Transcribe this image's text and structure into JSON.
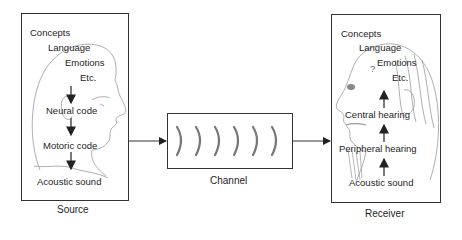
{
  "diagram": {
    "source": {
      "caption": "Source",
      "labels": [
        "Concepts",
        "Language",
        "Emotions",
        "Etc.",
        "Neural code",
        "Motoric code",
        "Acoustic sound"
      ]
    },
    "channel": {
      "caption": "Channel",
      "wave_count": 6,
      "wave_color": "#777777"
    },
    "receiver": {
      "caption": "Receiver",
      "labels": [
        "Concepts",
        "Language",
        "Emotions",
        "Etc.",
        "Central hearing",
        "Peripheral hearing",
        "Acoustic sound"
      ],
      "question_mark": "?"
    },
    "colors": {
      "line": "#333333",
      "sketch": "#9a9a9a",
      "text": "#1e1e1e"
    }
  }
}
